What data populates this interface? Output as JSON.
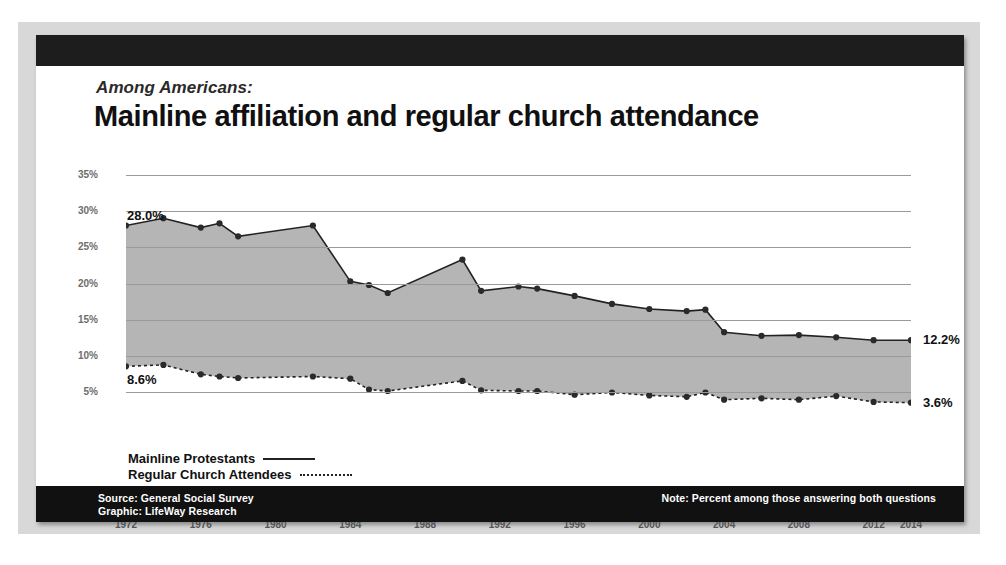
{
  "header": {
    "kicker": "Among Americans:",
    "headline": "Mainline affiliation and regular church attendance"
  },
  "legend": [
    {
      "label": "Mainline Protestants",
      "style": "solid"
    },
    {
      "label": "Regular Church Attendees",
      "style": "dotted"
    }
  ],
  "footer": {
    "source": "Source: General Social Survey",
    "graphic": "Graphic: LifeWay Research",
    "note": "Note: Percent among those answering both questions"
  },
  "callouts": {
    "start_mainline": "28.0%",
    "start_attendees": "8.6%",
    "end_mainline": "12.2%",
    "end_attendees": "3.6%"
  },
  "colors": {
    "frame": "#1d1d1d",
    "mat": "#d8d8d8",
    "area_fill": "#a8a8a8",
    "line": "#222222",
    "grid": "#9a9a9a",
    "footer_bg": "#111111"
  },
  "chart_data": {
    "type": "line",
    "title": "Mainline affiliation and regular church attendance",
    "subtitle": "Among Americans:",
    "xlabel": "",
    "ylabel": "",
    "ylim": [
      0,
      35
    ],
    "ytick_labels": [
      "35%",
      "30%",
      "25%",
      "20%",
      "15%",
      "10%",
      "5%"
    ],
    "ytick_values": [
      35,
      30,
      25,
      20,
      15,
      10,
      5
    ],
    "xlim": [
      1972,
      2014
    ],
    "xtick_labels": [
      "1972",
      "1976",
      "1980",
      "1984",
      "1988",
      "1992",
      "1996",
      "2000",
      "2004",
      "2008",
      "2012",
      "2014"
    ],
    "xtick_values": [
      1972,
      1976,
      1980,
      1984,
      1988,
      1992,
      1996,
      2000,
      2004,
      2008,
      2012,
      2014
    ],
    "grid": true,
    "legend_position": "below-left",
    "x": [
      1972,
      1974,
      1976,
      1977,
      1978,
      1982,
      1984,
      1985,
      1986,
      1990,
      1991,
      1993,
      1994,
      1996,
      1998,
      2000,
      2002,
      2003,
      2004,
      2006,
      2008,
      2010,
      2012,
      2014
    ],
    "series": [
      {
        "name": "Mainline Protestants",
        "style": "solid-area",
        "values": [
          28.0,
          29.0,
          27.7,
          28.3,
          26.5,
          28.0,
          20.3,
          19.8,
          18.7,
          23.3,
          19.0,
          19.6,
          19.3,
          18.3,
          17.2,
          16.5,
          16.2,
          16.4,
          13.3,
          12.8,
          12.9,
          12.6,
          12.2,
          12.2
        ]
      },
      {
        "name": "Regular Church Attendees",
        "style": "dotted",
        "values": [
          8.6,
          8.8,
          7.5,
          7.2,
          7.0,
          7.2,
          6.9,
          5.4,
          5.2,
          6.6,
          5.3,
          5.2,
          5.2,
          4.7,
          5.0,
          4.6,
          4.4,
          5.0,
          4.0,
          4.2,
          4.0,
          4.5,
          3.7,
          3.6
        ]
      }
    ],
    "annotations": [
      {
        "text": "28.0%",
        "series": "Mainline Protestants",
        "x": 1972,
        "y": 28.0
      },
      {
        "text": "8.6%",
        "series": "Regular Church Attendees",
        "x": 1972,
        "y": 8.6
      },
      {
        "text": "12.2%",
        "series": "Mainline Protestants",
        "x": 2014,
        "y": 12.2
      },
      {
        "text": "3.6%",
        "series": "Regular Church Attendees",
        "x": 2014,
        "y": 3.6
      }
    ]
  }
}
